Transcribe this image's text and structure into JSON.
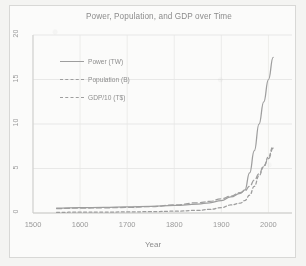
{
  "chart_data": {
    "type": "line",
    "title": "Power, Population, and GDP over Time",
    "xlabel": "Year",
    "ylabel": "",
    "xlim": [
      1500,
      2050
    ],
    "ylim": [
      0,
      20
    ],
    "grid": true,
    "legend_position": "upper-left",
    "xticks": [
      "1500",
      "1600",
      "1700",
      "1800",
      "1900",
      "2000"
    ],
    "xtick_values": [
      1500,
      1600,
      1700,
      1800,
      1900,
      2000
    ],
    "yticks": [
      "0",
      "5",
      "10",
      "15",
      "20"
    ],
    "ytick_values": [
      0,
      5,
      10,
      15,
      20
    ],
    "x": [
      1550,
      1600,
      1650,
      1700,
      1750,
      1800,
      1850,
      1875,
      1900,
      1920,
      1940,
      1950,
      1960,
      1970,
      1980,
      1990,
      2000,
      2010
    ],
    "series": [
      {
        "name": "Power (TW)",
        "style": "solid",
        "color": "#9e9e9e",
        "values": [
          0.55,
          0.6,
          0.62,
          0.68,
          0.75,
          0.85,
          1.0,
          1.15,
          1.4,
          1.8,
          2.2,
          2.6,
          4.5,
          7.0,
          10.0,
          12.5,
          15.0,
          17.5
        ]
      },
      {
        "name": "Population (B)",
        "style": "long-dash",
        "color": "#9e9e9e",
        "values": [
          0.5,
          0.55,
          0.58,
          0.62,
          0.72,
          0.9,
          1.15,
          1.3,
          1.6,
          1.9,
          2.3,
          2.5,
          3.0,
          3.7,
          4.4,
          5.3,
          6.1,
          7.3
        ]
      },
      {
        "name": "GDP/10 (T$)",
        "style": "short-dash",
        "color": "#9e9e9e",
        "values": [
          0.08,
          0.09,
          0.1,
          0.12,
          0.15,
          0.2,
          0.3,
          0.4,
          0.6,
          0.9,
          1.1,
          1.4,
          2.0,
          3.0,
          4.2,
          5.2,
          6.3,
          7.5
        ]
      }
    ]
  },
  "legend": {
    "items": [
      {
        "label": "Power (TW)"
      },
      {
        "label": "Population (B)"
      },
      {
        "label": "GDP/10 (T$)"
      }
    ]
  }
}
